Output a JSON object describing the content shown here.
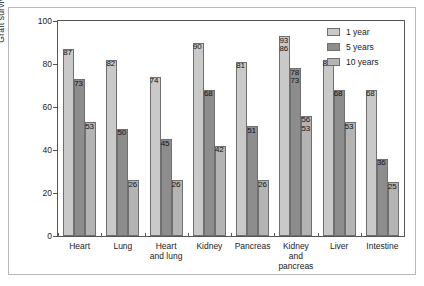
{
  "chart_data": {
    "type": "bar",
    "title": "",
    "xlabel": "",
    "ylabel": "Graft survival (%)",
    "ylim": [
      0,
      100
    ],
    "yticks": [
      0,
      20,
      40,
      60,
      80,
      100
    ],
    "grid": false,
    "legend_position": "top-right",
    "categories": [
      "Heart",
      "Lung",
      "Heart\nand lung",
      "Kidney",
      "Pancreas",
      "Kidney\nand\npancreas",
      "Liver",
      "Intestine"
    ],
    "series": [
      {
        "name": "1 year",
        "color": "#c9c9c9",
        "values": [
          87,
          82,
          74,
          90,
          81,
          93,
          82,
          68
        ]
      },
      {
        "name": "5 years",
        "color": "#8d8d8d",
        "values": [
          73,
          50,
          45,
          68,
          51,
          78,
          68,
          36
        ]
      },
      {
        "name": "10 years",
        "color": "#b4b4b4",
        "values": [
          53,
          26,
          26,
          42,
          26,
          56,
          53,
          25
        ]
      }
    ],
    "secondary_labels": {
      "note": "Kidney and pancreas group shows a second lower number beneath each bar label",
      "category": "Kidney\nand\npancreas",
      "values": [
        86,
        73,
        53
      ]
    }
  },
  "legend": {
    "items": [
      {
        "label": "1 year",
        "color": "#c9c9c9"
      },
      {
        "label": "5 years",
        "color": "#8d8d8d"
      },
      {
        "label": "10 years",
        "color": "#b4b4b4"
      }
    ]
  },
  "axis": {
    "y_label": "Graft survival (%)",
    "y_ticks": [
      "0",
      "20",
      "40",
      "60",
      "80",
      "100"
    ]
  },
  "categories_display": [
    [
      "Heart"
    ],
    [
      "Lung"
    ],
    [
      "Heart",
      "and lung"
    ],
    [
      "Kidney"
    ],
    [
      "Pancreas"
    ],
    [
      "Kidney",
      "and",
      "pancreas"
    ],
    [
      "Liver"
    ],
    [
      "Intestine"
    ]
  ]
}
